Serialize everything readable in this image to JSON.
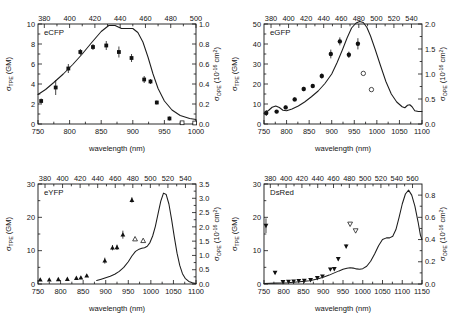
{
  "figure": {
    "name": "two-photon and one-photon cross-section spectra of fluorescent proteins",
    "panel_count": 4,
    "axis_titles": {
      "x": "wavelength (nm)",
      "y_left_sym": "σ",
      "y_left_sub": "TPE",
      "y_left_unit": " (GM)",
      "y_right_sym": "σ",
      "y_right_sub": "OPE",
      "y_right_unit_open": " (10",
      "y_right_unit_exp": "-16",
      "y_right_unit_close": " cm",
      "y_right_unit_exp2": "2",
      "y_right_unit_end": ")"
    }
  },
  "chart_data": [
    {
      "id": "ecfp",
      "type": "scatter",
      "title": "eCFP",
      "position": "top-left",
      "xlabel": "wavelength (nm)",
      "ylabel": "σTPE (GM)",
      "ylabel_right": "σOPE (10-16 cm2)",
      "xlim": [
        750,
        1000
      ],
      "xticks": [
        750,
        800,
        850,
        900,
        950,
        1000
      ],
      "xticklabels": [
        "750",
        "800",
        "850",
        "900",
        "950",
        "1000"
      ],
      "top_axis_lim": [
        375,
        500
      ],
      "top_xticks": [
        380,
        400,
        420,
        440,
        460,
        480,
        500
      ],
      "top_xticklabels": [
        "380",
        "400",
        "420",
        "440",
        "460",
        "480",
        "500"
      ],
      "ylim": [
        0,
        10
      ],
      "yticks": [
        0,
        2,
        4,
        6,
        8,
        10
      ],
      "yticklabels": [
        "0",
        "2",
        "4",
        "6",
        "8",
        "10"
      ],
      "ylim_right": [
        0.0,
        1.0
      ],
      "yticks_right": [
        0.0,
        0.2,
        0.4,
        0.6,
        0.8,
        1.0
      ],
      "yticklabels_right": [
        "0.0",
        "0.2",
        "0.4",
        "0.6",
        "0.8",
        "1.0"
      ],
      "grid": false,
      "legend": false,
      "series": [
        {
          "name": "TPE cross-section (filled squares)",
          "marker": "filled-square",
          "x": [
            755,
            778,
            798,
            817,
            837,
            858,
            878,
            898,
            918,
            928,
            938,
            958
          ],
          "y": [
            2.3,
            3.65,
            5.55,
            7.2,
            7.7,
            7.85,
            7.2,
            6.6,
            4.45,
            4.25,
            2.15,
            0.55
          ],
          "yerr": [
            0.25,
            0.75,
            0.45,
            0.3,
            0.3,
            0.45,
            0.55,
            0.4,
            0.35,
            0.25,
            0.2,
            0.2
          ]
        },
        {
          "name": "upper-limit points (open squares)",
          "marker": "open-square",
          "x": [
            978,
            998
          ],
          "y": [
            0.12,
            0.1
          ],
          "yerr": [
            0,
            0
          ]
        },
        {
          "name": "OPE absorption spectrum (solid line, right axis)",
          "marker": "line",
          "x": [
            750,
            762,
            775,
            790,
            805,
            820,
            835,
            850,
            862,
            872,
            882,
            892,
            900,
            908,
            916,
            924,
            932,
            940,
            950,
            962,
            975,
            990,
            1000
          ],
          "y_right": [
            0.295,
            0.345,
            0.415,
            0.5,
            0.595,
            0.7,
            0.815,
            0.925,
            0.985,
            0.985,
            0.955,
            0.955,
            0.955,
            0.915,
            0.82,
            0.67,
            0.5,
            0.355,
            0.23,
            0.14,
            0.085,
            0.055,
            0.045
          ]
        }
      ]
    },
    {
      "id": "egfp",
      "type": "scatter",
      "title": "eGFP",
      "position": "top-right",
      "xlabel": "wavelength (nm)",
      "ylabel": "σTPE (GM)",
      "ylabel_right": "σOPE (10-16 cm2)",
      "xlim": [
        750,
        1100
      ],
      "xticks": [
        750,
        800,
        850,
        900,
        950,
        1000,
        1050,
        1100
      ],
      "xticklabels": [
        "750",
        "800",
        "850",
        "900",
        "950",
        "1000",
        "1050",
        "1100"
      ],
      "top_axis_lim": [
        372,
        552
      ],
      "top_xticks": [
        380,
        400,
        420,
        440,
        460,
        480,
        500,
        520,
        540
      ],
      "top_xticklabels": [
        "380",
        "400",
        "420",
        "440",
        "460",
        "480",
        "500",
        "520",
        "540"
      ],
      "ylim": [
        0,
        50
      ],
      "yticks": [
        0,
        10,
        20,
        30,
        40,
        50
      ],
      "yticklabels": [
        "0",
        "10",
        "20",
        "30",
        "40",
        "50"
      ],
      "ylim_right": [
        0.0,
        2.0
      ],
      "yticks_right": [
        0.0,
        0.5,
        1.0,
        1.5,
        2.0
      ],
      "yticklabels_right": [
        "0.0",
        "0.5",
        "1.0",
        "1.5",
        "2.0"
      ],
      "grid": false,
      "legend": false,
      "series": [
        {
          "name": "TPE cross-section (filled circles)",
          "marker": "filled-circle",
          "x": [
            755,
            778,
            798,
            818,
            838,
            858,
            878,
            898,
            918,
            938,
            958
          ],
          "y": [
            5.5,
            6.2,
            8.3,
            12.3,
            17.5,
            19.0,
            24.0,
            35.0,
            41.3,
            34.6,
            40.1
          ],
          "yerr": [
            1.5,
            0.8,
            0.9,
            1.0,
            1.1,
            1.0,
            1.3,
            2.2,
            2.0,
            1.6,
            2.8
          ]
        },
        {
          "name": "upper-limit points (open circles)",
          "marker": "open-circle",
          "x": [
            970,
            988
          ],
          "y": [
            25.3,
            17.2
          ],
          "yerr": [
            0,
            0
          ]
        },
        {
          "name": "OPE absorption spectrum (solid line, right axis)",
          "marker": "line",
          "x": [
            750,
            760,
            768,
            776,
            784,
            792,
            800,
            812,
            826,
            840,
            855,
            870,
            885,
            900,
            912,
            924,
            934,
            944,
            954,
            962,
            970,
            978,
            986,
            996,
            1008,
            1020,
            1032,
            1044,
            1056,
            1062,
            1068,
            1073,
            1078,
            1084,
            1092,
            1100
          ],
          "y_right": [
            0.215,
            0.27,
            0.335,
            0.36,
            0.33,
            0.275,
            0.265,
            0.3,
            0.36,
            0.44,
            0.545,
            0.66,
            0.81,
            1.0,
            1.23,
            1.49,
            1.72,
            1.92,
            2.02,
            2.05,
            2.03,
            1.93,
            1.76,
            1.5,
            1.17,
            0.85,
            0.6,
            0.44,
            0.345,
            0.325,
            0.375,
            0.385,
            0.345,
            0.265,
            0.25,
            0.25
          ]
        }
      ]
    },
    {
      "id": "eyfp",
      "type": "scatter",
      "title": "eYFP",
      "position": "bottom-left",
      "xlabel": "wavelength (nm)",
      "ylabel": "σTPE (GM)",
      "ylabel_right": "σOPE (10-16 cm2)",
      "xlim": [
        750,
        1100
      ],
      "xticks": [
        750,
        800,
        850,
        900,
        950,
        1000,
        1050,
        1100
      ],
      "xticklabels": [
        "750",
        "800",
        "850",
        "900",
        "950",
        "1000",
        "1050",
        "1100"
      ],
      "top_axis_lim": [
        372,
        552
      ],
      "top_xticks": [
        380,
        400,
        420,
        440,
        460,
        480,
        500,
        520,
        540
      ],
      "top_xticklabels": [
        "380",
        "400",
        "420",
        "440",
        "460",
        "480",
        "500",
        "520",
        "540"
      ],
      "ylim": [
        0,
        30
      ],
      "yticks": [
        0,
        10,
        20,
        30
      ],
      "yticklabels": [
        "0",
        "10",
        "20",
        "30"
      ],
      "ylim_right": [
        0.0,
        3.5
      ],
      "yticks_right": [
        0.0,
        0.5,
        1.0,
        1.5,
        2.0,
        2.5,
        3.0,
        3.5
      ],
      "yticklabels_right": [
        "0.0",
        "0.5",
        "1.0",
        "1.5",
        "2.0",
        "2.5",
        "3.0",
        "3.5"
      ],
      "grid": false,
      "legend": false,
      "series": [
        {
          "name": "TPE cross-section (filled up triangles)",
          "marker": "filled-triangle-up",
          "x": [
            755,
            775,
            795,
            815,
            835,
            845,
            858,
            898,
            915,
            925,
            938,
            958
          ],
          "y": [
            1.3,
            1.3,
            1.4,
            1.5,
            1.8,
            1.9,
            2.5,
            7.0,
            10.9,
            11.0,
            14.8,
            25.2
          ],
          "yerr": [
            0.3,
            0.3,
            0.3,
            0.3,
            0.3,
            0.3,
            0.3,
            0.9,
            0.8,
            0.8,
            1.2,
            0.8
          ]
        },
        {
          "name": "upper-limit points (open up triangles)",
          "marker": "open-triangle-up",
          "x": [
            965,
            983
          ],
          "y": [
            13.5,
            13.0
          ],
          "yerr": [
            0,
            0
          ]
        },
        {
          "name": "OPE absorption spectrum (solid line, right axis)",
          "marker": "line",
          "x": [
            880,
            890,
            900,
            910,
            920,
            930,
            940,
            950,
            958,
            966,
            974,
            980,
            986,
            992,
            998,
            1004,
            1010,
            1016,
            1022,
            1028,
            1034,
            1040,
            1046,
            1052,
            1058,
            1064,
            1070,
            1076,
            1084,
            1092,
            1100
          ],
          "y_right": [
            0.12,
            0.17,
            0.22,
            0.27,
            0.34,
            0.44,
            0.58,
            0.78,
            0.98,
            1.14,
            1.22,
            1.25,
            1.27,
            1.32,
            1.45,
            1.68,
            2.02,
            2.46,
            2.9,
            3.18,
            3.13,
            2.8,
            2.25,
            1.64,
            1.08,
            0.65,
            0.36,
            0.2,
            0.09,
            0.04,
            0.02
          ]
        }
      ]
    },
    {
      "id": "dsred",
      "type": "scatter",
      "title": "DsRed",
      "position": "bottom-right",
      "xlabel": "wavelength (nm)",
      "ylabel": "σTPE (GM)",
      "ylabel_right": "σOPE (10-16 cm2)",
      "xlim": [
        750,
        1150
      ],
      "xticks": [
        750,
        800,
        850,
        900,
        950,
        1000,
        1050,
        1100,
        1150
      ],
      "xticklabels": [
        "750",
        "800",
        "850",
        "900",
        "950",
        "1000",
        "1050",
        "1100",
        "1150"
      ],
      "top_axis_lim": [
        372,
        572
      ],
      "top_xticks": [
        380,
        400,
        420,
        440,
        460,
        480,
        500,
        520,
        540,
        560
      ],
      "top_xticklabels": [
        "380",
        "400",
        "420",
        "440",
        "460",
        "480",
        "500",
        "520",
        "540",
        "560"
      ],
      "ylim": [
        0,
        30
      ],
      "yticks": [
        0,
        10,
        20,
        30
      ],
      "yticklabels": [
        "0",
        "10",
        "20",
        "30"
      ],
      "ylim_right": [
        0.0,
        0.9
      ],
      "yticks_right": [
        0.0,
        0.2,
        0.4,
        0.6,
        0.8
      ],
      "yticklabels_right": [
        "0.0",
        "0.2",
        "0.4",
        "0.6",
        "0.8"
      ],
      "grid": false,
      "legend": false,
      "series": [
        {
          "name": "TPE cross-section (filled down triangles)",
          "marker": "filled-triangle-down",
          "x": [
            755,
            778,
            798,
            812,
            825,
            838,
            852,
            868,
            885,
            898,
            918,
            928,
            938,
            958
          ],
          "y": [
            17.5,
            3.4,
            0.6,
            0.7,
            0.8,
            0.9,
            1.0,
            1.2,
            1.8,
            2.3,
            4.4,
            4.5,
            7.5,
            11.3
          ],
          "yerr": [
            2.2,
            0.4,
            0.2,
            0.2,
            0.2,
            0.2,
            0.2,
            0.2,
            0.3,
            0.3,
            0.4,
            0.4,
            0.5,
            0.6
          ]
        },
        {
          "name": "upper-limit points (open down triangles)",
          "marker": "open-triangle-down",
          "x": [
            968,
            982
          ],
          "y": [
            18.0,
            16.0
          ],
          "yerr": [
            0,
            0
          ]
        },
        {
          "name": "OPE absorption spectrum (solid line, right axis)",
          "marker": "line",
          "x": [
            750,
            780,
            810,
            840,
            865,
            885,
            900,
            915,
            928,
            940,
            950,
            960,
            968,
            976,
            984,
            992,
            1000,
            1010,
            1020,
            1030,
            1040,
            1050,
            1060,
            1068,
            1076,
            1084,
            1092,
            1100,
            1108,
            1116,
            1124,
            1132,
            1140,
            1146,
            1150
          ],
          "y_right": [
            0.005,
            0.008,
            0.012,
            0.02,
            0.03,
            0.045,
            0.06,
            0.08,
            0.1,
            0.118,
            0.132,
            0.142,
            0.146,
            0.143,
            0.136,
            0.132,
            0.138,
            0.16,
            0.205,
            0.27,
            0.345,
            0.4,
            0.415,
            0.415,
            0.43,
            0.49,
            0.6,
            0.72,
            0.81,
            0.845,
            0.8,
            0.7,
            0.56,
            0.44,
            0.4
          ]
        }
      ]
    }
  ]
}
